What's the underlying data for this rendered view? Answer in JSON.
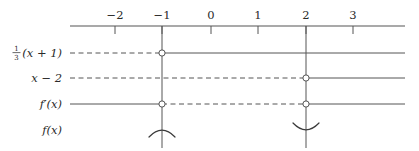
{
  "figure": {
    "kind": "sign-chart",
    "background_color": "#ffffff",
    "line_color": "#555555",
    "text_color": "#2a2a2a",
    "circle_fill": "#ffffff"
  },
  "axis": {
    "name": "number-line",
    "x_start": 70,
    "x_end": 405,
    "y": 26,
    "tick_length": 8,
    "ticks": [
      {
        "label": "−2",
        "value": -2,
        "x": 115
      },
      {
        "label": "−1",
        "value": -1,
        "x": 162
      },
      {
        "label": "0",
        "value": 0,
        "x": 211
      },
      {
        "label": "1",
        "value": 1,
        "x": 258
      },
      {
        "label": "2",
        "value": 2,
        "x": 306
      },
      {
        "label": "3",
        "value": 3,
        "x": 353
      }
    ]
  },
  "critical_lines": [
    {
      "name": "critical-line-minus-one",
      "value": -1,
      "x": 162,
      "y_top": 26,
      "y_bottom": 148
    },
    {
      "name": "critical-line-two",
      "value": 2,
      "x": 306,
      "y_top": 26,
      "y_bottom": 148
    }
  ],
  "rows": [
    {
      "id": "row-one-third-x-plus-1",
      "label_type": "fraction-expression",
      "label_parts": {
        "numerator": "1",
        "denominator": "3",
        "rest": "(x + 1)"
      },
      "label_plain": "⅓(x + 1)",
      "y": 53,
      "label_x": 62,
      "segments": [
        {
          "style": "dashed",
          "x1": 70,
          "x2": 162
        },
        {
          "style": "solid",
          "x1": 162,
          "x2": 405
        }
      ],
      "open_circles": [
        {
          "x": 162,
          "value": -1
        }
      ]
    },
    {
      "id": "row-x-minus-2",
      "label_type": "expression",
      "label_plain": "x − 2",
      "y": 78,
      "label_x": 62,
      "segments": [
        {
          "style": "dashed",
          "x1": 70,
          "x2": 306
        },
        {
          "style": "solid",
          "x1": 306,
          "x2": 405
        }
      ],
      "open_circles": [
        {
          "x": 306,
          "value": 2
        }
      ]
    },
    {
      "id": "row-f-prime-x",
      "label_type": "expression",
      "label_plain": "f′(x)",
      "y": 104,
      "label_x": 62,
      "segments": [
        {
          "style": "solid",
          "x1": 70,
          "x2": 162
        },
        {
          "style": "dashed",
          "x1": 162,
          "x2": 306
        },
        {
          "style": "solid",
          "x1": 306,
          "x2": 405
        }
      ],
      "open_circles": [
        {
          "x": 162,
          "value": -1
        },
        {
          "x": 306,
          "value": 2
        }
      ]
    },
    {
      "id": "row-f-x",
      "label_type": "expression",
      "label_plain": "f(x)",
      "y": 130,
      "label_x": 62,
      "segments": [],
      "open_circles": [],
      "concavity_arcs": [
        {
          "name": "arc-concave-down-at-minus-one",
          "x": 162,
          "value": -1,
          "shape": "frown",
          "width": 26,
          "depth": 7
        },
        {
          "name": "arc-concave-up-at-two",
          "x": 306,
          "value": 2,
          "shape": "smile",
          "width": 26,
          "depth": 7
        }
      ]
    }
  ]
}
